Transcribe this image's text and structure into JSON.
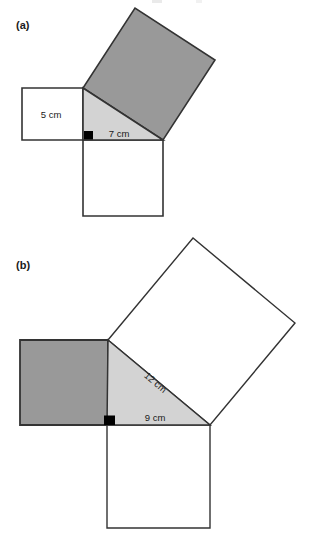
{
  "page": {
    "background_color": "#ffffff",
    "width": 322,
    "height": 549
  },
  "style": {
    "shaded_square_fill": "#999999",
    "triangle_fill": "#d3d3d3",
    "white_square_fill": "#ffffff",
    "stroke_color": "#333333",
    "right_angle_marker_color": "#000000",
    "text_color": "#1a1a1a"
  },
  "figures": [
    {
      "id": "a",
      "label": "(a)",
      "description": "Right triangle with squares drawn on each side; the square on the hypotenuse is shaded.",
      "right_angle_marker": true,
      "triangle": {
        "legs": [
          {
            "name": "vertical-leg",
            "label": "5 cm",
            "value": 5,
            "unit": "cm"
          },
          {
            "name": "horizontal-leg",
            "label": "7 cm",
            "value": 7,
            "unit": "cm"
          }
        ],
        "hypotenuse": {
          "name": "hypotenuse",
          "label": "",
          "value": null,
          "unit": "cm"
        }
      },
      "squares": [
        {
          "on": "vertical-leg",
          "shaded": false,
          "label": "5 cm"
        },
        {
          "on": "horizontal-leg",
          "shaded": false,
          "label": "7 cm"
        },
        {
          "on": "hypotenuse",
          "shaded": true,
          "label": ""
        }
      ],
      "dimension_labels": [
        {
          "id": "a-leg-vertical",
          "text": "5 cm",
          "rotation": 0
        },
        {
          "id": "a-leg-horizontal",
          "text": "7 cm",
          "rotation": 0
        }
      ]
    },
    {
      "id": "b",
      "label": "(b)",
      "description": "Right triangle with squares drawn on each side; the square on the vertical leg is shaded.",
      "right_angle_marker": true,
      "triangle": {
        "legs": [
          {
            "name": "vertical-leg",
            "label": "",
            "value": null,
            "unit": "cm"
          },
          {
            "name": "horizontal-leg",
            "label": "9 cm",
            "value": 9,
            "unit": "cm"
          }
        ],
        "hypotenuse": {
          "name": "hypotenuse",
          "label": "12 cm",
          "value": 12,
          "unit": "cm"
        }
      },
      "squares": [
        {
          "on": "vertical-leg",
          "shaded": true,
          "label": ""
        },
        {
          "on": "horizontal-leg",
          "shaded": false,
          "label": "9 cm"
        },
        {
          "on": "hypotenuse",
          "shaded": false,
          "label": "12 cm"
        }
      ],
      "dimension_labels": [
        {
          "id": "b-hypotenuse",
          "text": "12 cm",
          "rotation": 40
        },
        {
          "id": "b-leg-horizontal",
          "text": "9 cm",
          "rotation": 0
        }
      ]
    }
  ]
}
